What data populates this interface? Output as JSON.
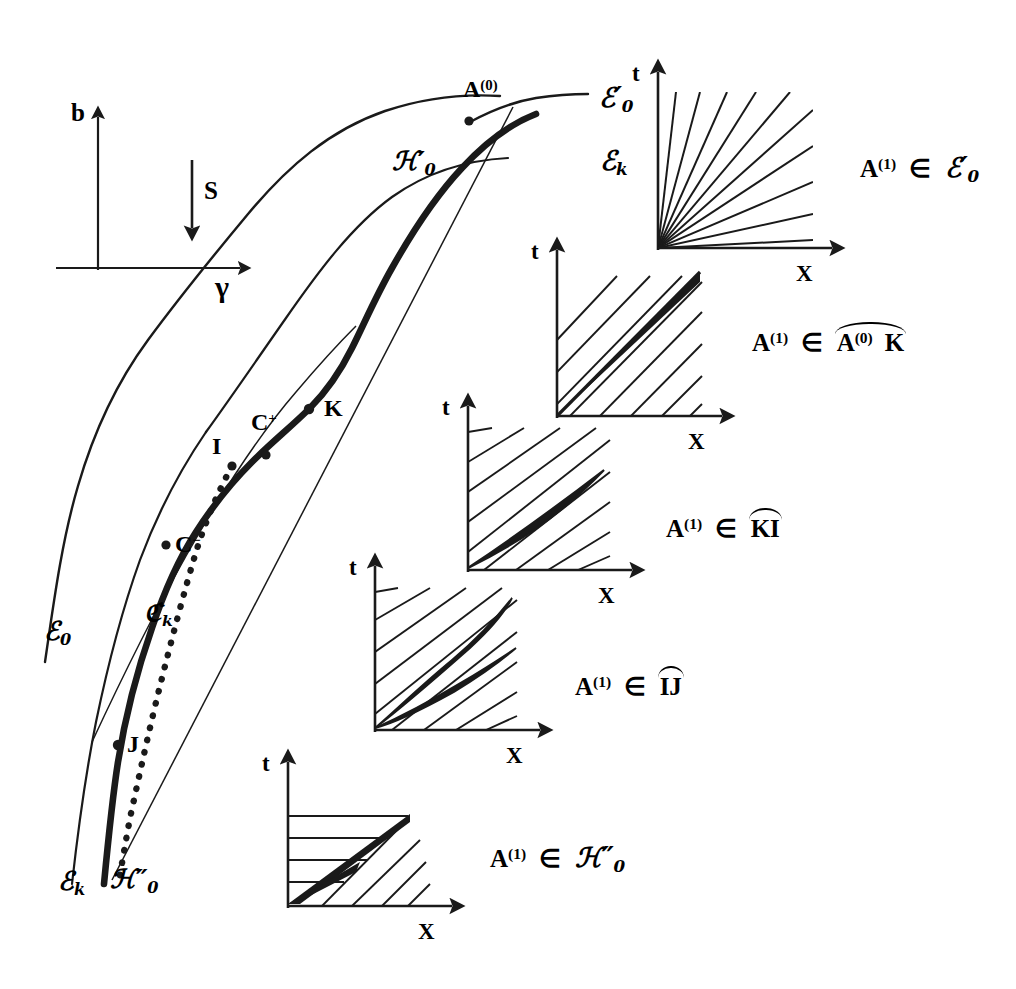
{
  "figure": {
    "type": "shock-wave-bifurcation-diagram",
    "background": "#ffffff",
    "ink": "#1a1a1a"
  },
  "axes_inset": {
    "y_label": "b",
    "x_label": "γ",
    "s_label": "S",
    "s_arrow": "down"
  },
  "main_curve_labels": {
    "A0": "A",
    "A0_sup": "(0)",
    "T0_prime": "ℰ",
    "T0_prime_sub": "0",
    "T0_prime_prime_mark": "′",
    "H0_prime": "ℋ",
    "H0_prime_sub": "0",
    "Tk_top": "ℰ",
    "Tk_top_sub": "k",
    "K": "K",
    "C_plus": "C",
    "C_plus_sup": "+",
    "I": "I",
    "C_minus": "C",
    "C_minus_sup": "−",
    "Ck": "ℭ",
    "Ck_sub": "k",
    "J": "J",
    "T0": "ℰ",
    "T0_sub": "0",
    "Tk_bottom": "ℰ",
    "Tk_bottom_sub": "k",
    "H0_dprime": "ℋ",
    "H0_dprime_sub": "0"
  },
  "insets": [
    {
      "id": "inset-1",
      "t_label": "t",
      "x_label": "X",
      "caption_A": "A",
      "caption_sup": "(1)",
      "caption_in": "∈",
      "caption_set": "ℰ",
      "caption_set_sub": "0",
      "caption_set_prime": "′",
      "caption_arc": false,
      "description": "full rarefaction fan from origin, no thick ray"
    },
    {
      "id": "inset-2",
      "t_label": "t",
      "x_label": "X",
      "caption_A": "A",
      "caption_sup": "(1)",
      "caption_in": "∈",
      "caption_arc_text_left": "A",
      "caption_arc_sup": "(0)",
      "caption_arc_text_right": "K",
      "caption_arc": true,
      "description": "single thick shock ray at 45 degrees with uniform hatching"
    },
    {
      "id": "inset-3",
      "t_label": "t",
      "x_label": "X",
      "caption_A": "A",
      "caption_sup": "(1)",
      "caption_in": "∈",
      "caption_arc_text": "KI",
      "caption_arc": true,
      "description": "narrow lens shaped double thick ray with uniform hatching"
    },
    {
      "id": "inset-4",
      "t_label": "t",
      "x_label": "X",
      "caption_A": "A",
      "caption_sup": "(1)",
      "caption_in": "∈",
      "caption_arc_text": "IJ",
      "caption_arc": true,
      "description": "two diverging thick rays with dense cluster at origin"
    },
    {
      "id": "inset-5",
      "t_label": "t",
      "x_label": "X",
      "caption_A": "A",
      "caption_sup": "(1)",
      "caption_in": "∈",
      "caption_set": "ℋ",
      "caption_set_sub": "0",
      "caption_set_dprime": "″",
      "caption_arc": false,
      "description": "shallow fan, horizontal hatching above, steep hatching below"
    }
  ]
}
